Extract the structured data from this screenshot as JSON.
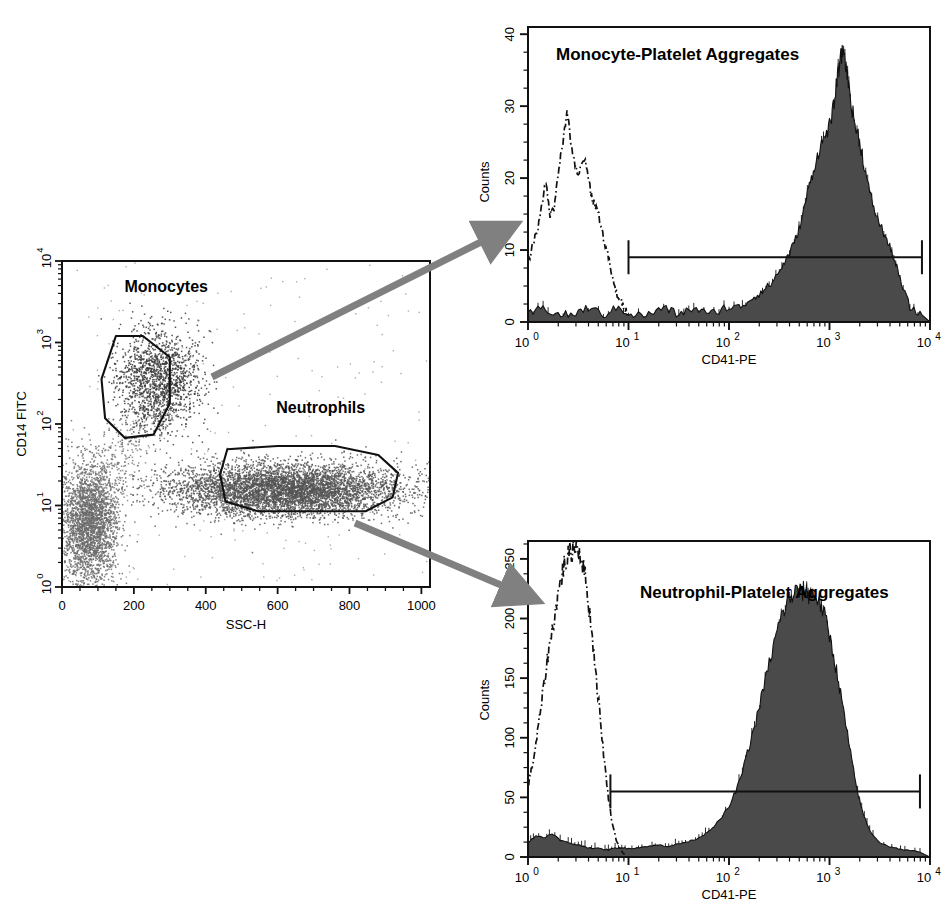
{
  "figure": {
    "kind": "flow-cytometry-figure",
    "panels": [
      "scatter-gating-plot",
      "monocyte-histogram",
      "neutrophil-histogram"
    ],
    "arrow_color": "#808080",
    "ink_color": "#1a1a1a",
    "fill_color": "#4d4d4d",
    "scatter_dot_color": "#5a5a5a"
  },
  "scatter": {
    "title": "",
    "xlabel": "SSC-H",
    "ylabel": "CD14 FITC",
    "xticks": [
      "0",
      "200",
      "400",
      "600",
      "800",
      "1000"
    ],
    "xtick_values": [
      0,
      200,
      400,
      600,
      800,
      1000
    ],
    "yticks": [
      "10 0",
      "10 1",
      "10 2",
      "10 3",
      "10 4"
    ],
    "ytick_exponents": [
      0,
      1,
      2,
      3,
      4
    ],
    "gates": [
      {
        "label": "Monocytes"
      },
      {
        "label": "Neutrophils"
      }
    ]
  },
  "hist_top": {
    "title": "Monocyte-Platelet Aggregates",
    "xlabel": "CD41-PE",
    "ylabel": "Counts",
    "yticks": [
      "0",
      "10",
      "20",
      "30",
      "40"
    ],
    "ytick_values": [
      0,
      10,
      20,
      30,
      40
    ],
    "xticks": [
      "10 0",
      "10 1",
      "10 2",
      "10 3",
      "10 4"
    ],
    "xtick_exponents": [
      0,
      1,
      2,
      3,
      4
    ],
    "marker": {
      "name": "M1",
      "y_level": 9,
      "x_start_decade": 1.0,
      "x_end_decade": 3.92
    }
  },
  "hist_bottom": {
    "title": "Neutrophil-Platelet Aggregates",
    "xlabel": "CD41-PE",
    "ylabel": "Counts",
    "yticks": [
      "0",
      "50",
      "100",
      "150",
      "200",
      "250"
    ],
    "ytick_values": [
      0,
      50,
      100,
      150,
      200,
      250
    ],
    "xticks": [
      "10 0",
      "10 1",
      "10 2",
      "10 3",
      "10 4"
    ],
    "xtick_exponents": [
      0,
      1,
      2,
      3,
      4
    ],
    "marker": {
      "name": "M1",
      "y_level": 55,
      "x_start_decade": 0.82,
      "x_end_decade": 3.9
    }
  },
  "chart_data": [
    {
      "type": "scatter",
      "id": "scatter-gating-plot",
      "title": "",
      "xlabel": "SSC-H",
      "ylabel": "CD14 FITC",
      "xlim": [
        0,
        1024
      ],
      "ylim_log10": [
        0,
        4
      ],
      "xscale": "linear",
      "yscale": "log",
      "grid": false,
      "legend": "none",
      "populations": [
        {
          "name": "Lymphocytes",
          "gated": false,
          "center_x": 75,
          "center_y_log10": 0.78,
          "spread_x": 40,
          "spread_y_log10": 0.38,
          "n": 2600,
          "color": "#6b6b6b"
        },
        {
          "name": "Monocytes",
          "gated": true,
          "center_x": 265,
          "center_y_log10": 2.55,
          "spread_x": 58,
          "spread_y_log10": 0.3,
          "n": 1500,
          "color": "#3a3a3a"
        },
        {
          "name": "Neutrophils",
          "gated": true,
          "center_x": 620,
          "center_y_log10": 1.2,
          "spread_x": 160,
          "spread_y_log10": 0.16,
          "n": 5200,
          "color": "#555555"
        }
      ],
      "gate_polygons": [
        {
          "label": "Monocytes",
          "points_xy": [
            [
              150,
              3.08
            ],
            [
              225,
              3.08
            ],
            [
              300,
              2.82
            ],
            [
              300,
              2.25
            ],
            [
              255,
              1.87
            ],
            [
              175,
              1.83
            ],
            [
              120,
              2.07
            ],
            [
              110,
              2.55
            ]
          ]
        },
        {
          "label": "Neutrophils",
          "points_xy": [
            [
              460,
              1.69
            ],
            [
              600,
              1.73
            ],
            [
              760,
              1.73
            ],
            [
              880,
              1.62
            ],
            [
              935,
              1.4
            ],
            [
              920,
              1.1
            ],
            [
              845,
              0.93
            ],
            [
              545,
              0.93
            ],
            [
              455,
              1.05
            ],
            [
              440,
              1.38
            ]
          ]
        }
      ],
      "gate_label_positions": [
        {
          "label": "Monocytes",
          "x": 290,
          "y_log10": 3.62
        },
        {
          "label": "Neutrophils",
          "x": 720,
          "y_log10": 2.13
        }
      ]
    },
    {
      "type": "line",
      "id": "monocyte-histogram",
      "title": "Monocyte-Platelet Aggregates",
      "xlabel": "CD41-PE",
      "ylabel": "Counts",
      "xscale": "log",
      "xlim_log10": [
        0,
        4
      ],
      "ylim": [
        0,
        41
      ],
      "grid": false,
      "legend": "none",
      "series": [
        {
          "name": "Isotype control (dash-dot outline)",
          "style": "dash-dot",
          "filled": false,
          "x_log10": [
            0.0,
            0.05,
            0.1,
            0.14,
            0.18,
            0.22,
            0.26,
            0.3,
            0.34,
            0.38,
            0.42,
            0.46,
            0.5,
            0.55,
            0.6,
            0.64,
            0.68,
            0.72,
            0.76,
            0.8,
            0.84,
            0.88,
            0.92,
            0.96,
            1.0
          ],
          "values": [
            8,
            11,
            13,
            17,
            19,
            15,
            16,
            21,
            24,
            29,
            26,
            22,
            20,
            23,
            20,
            17,
            16,
            14,
            11,
            9,
            6,
            4,
            3,
            2,
            1
          ]
        },
        {
          "name": "CD41-PE stained monocytes (filled)",
          "style": "solid",
          "filled": true,
          "x_log10": [
            0.0,
            0.15,
            0.3,
            0.45,
            0.6,
            0.75,
            0.9,
            1.05,
            1.2,
            1.35,
            1.5,
            1.65,
            1.8,
            1.95,
            2.1,
            2.2,
            2.3,
            2.4,
            2.5,
            2.58,
            2.65,
            2.72,
            2.78,
            2.84,
            2.9,
            2.96,
            3.02,
            3.06,
            3.1,
            3.14,
            3.18,
            3.22,
            3.26,
            3.3,
            3.34,
            3.4,
            3.46,
            3.52,
            3.58,
            3.64,
            3.7,
            3.8,
            3.92
          ],
          "values": [
            1,
            2,
            1,
            1,
            2,
            1,
            2,
            1,
            1,
            2,
            1,
            2,
            1,
            2,
            2,
            3,
            4,
            5,
            7,
            9,
            11,
            14,
            18,
            21,
            24,
            26,
            28,
            32,
            36,
            38,
            34,
            30,
            27,
            25,
            22,
            18,
            15,
            13,
            11,
            9,
            6,
            2,
            1
          ]
        }
      ],
      "marker_gate": {
        "label": "M1",
        "from_log10": 1.0,
        "to_log10": 3.92,
        "y": 9
      }
    },
    {
      "type": "line",
      "id": "neutrophil-histogram",
      "title": "Neutrophil-Platelet Aggregates",
      "xlabel": "CD41-PE",
      "ylabel": "Counts",
      "xscale": "log",
      "xlim_log10": [
        0,
        4
      ],
      "ylim": [
        0,
        265
      ],
      "grid": false,
      "legend": "none",
      "series": [
        {
          "name": "Isotype control (dash-dot outline)",
          "style": "dash-dot",
          "filled": false,
          "x_log10": [
            0.0,
            0.04,
            0.08,
            0.12,
            0.16,
            0.2,
            0.24,
            0.28,
            0.32,
            0.36,
            0.4,
            0.44,
            0.48,
            0.52,
            0.56,
            0.6,
            0.64,
            0.68,
            0.72,
            0.76,
            0.8,
            0.84,
            0.88,
            0.92,
            0.96
          ],
          "values": [
            60,
            75,
            95,
            120,
            145,
            170,
            190,
            210,
            230,
            245,
            252,
            258,
            262,
            255,
            240,
            215,
            185,
            150,
            115,
            80,
            50,
            28,
            14,
            6,
            2
          ]
        },
        {
          "name": "CD41-PE stained neutrophils (filled)",
          "style": "solid",
          "filled": true,
          "x_log10": [
            0.0,
            0.08,
            0.16,
            0.24,
            0.32,
            0.4,
            0.5,
            0.6,
            0.7,
            0.8,
            0.9,
            1.0,
            1.1,
            1.2,
            1.3,
            1.4,
            1.5,
            1.6,
            1.7,
            1.8,
            1.9,
            2.0,
            2.1,
            2.2,
            2.28,
            2.36,
            2.44,
            2.5,
            2.56,
            2.62,
            2.68,
            2.72,
            2.76,
            2.8,
            2.84,
            2.9,
            2.96,
            3.02,
            3.08,
            3.14,
            3.2,
            3.26,
            3.32,
            3.4,
            3.5,
            3.62,
            3.75,
            3.9
          ],
          "values": [
            12,
            18,
            16,
            20,
            14,
            12,
            10,
            8,
            7,
            6,
            8,
            7,
            8,
            9,
            10,
            9,
            11,
            13,
            16,
            22,
            30,
            42,
            62,
            92,
            118,
            148,
            176,
            196,
            210,
            218,
            224,
            221,
            225,
            219,
            222,
            214,
            200,
            178,
            152,
            122,
            92,
            62,
            40,
            22,
            12,
            8,
            6,
            4
          ]
        }
      ],
      "marker_gate": {
        "label": "M1",
        "from_log10": 0.82,
        "to_log10": 3.9,
        "y": 55
      }
    }
  ]
}
